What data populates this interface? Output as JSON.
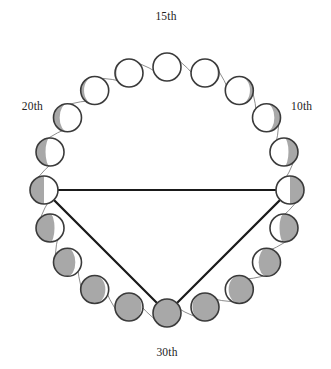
{
  "figure": {
    "background_color": "#ffffff",
    "ring": {
      "center_x": 167,
      "center_y": 190,
      "radius": 123,
      "arc_stroke_color": "#8d8d8d",
      "arc_stroke_width": 1
    },
    "moon_style": {
      "radius": 14,
      "outline_color": "#3a3a3a",
      "outline_width": 1.6,
      "lit_color": "#ffffff",
      "shadow_color": "#a8a8a8"
    },
    "triangle": {
      "stroke_color": "#1a1a1a",
      "stroke_width": 2.2,
      "vertices": [
        "20th",
        "10th",
        "30th"
      ]
    }
  },
  "labels": [
    {
      "id": "label-15th",
      "text": "15th",
      "x": 166,
      "y": 20,
      "anchor": "middle"
    },
    {
      "id": "label-10th",
      "text": "10th",
      "x": 291,
      "y": 110,
      "anchor": "start"
    },
    {
      "id": "label-20th",
      "text": "20th",
      "x": 43,
      "y": 110,
      "anchor": "end"
    },
    {
      "id": "label-30th",
      "text": "30th",
      "x": 167,
      "y": 356,
      "anchor": "middle"
    }
  ],
  "chart_data": {
    "type": "scatter",
    "xlabel": "",
    "ylabel": "",
    "grid": false,
    "legend": "none",
    "categories": [
      "1",
      "2",
      "3",
      "4",
      "5",
      "6",
      "7",
      "8",
      "9",
      "10",
      "11",
      "12",
      "13",
      "14",
      "15",
      "16",
      "17",
      "18",
      "19",
      "20"
    ],
    "values": [
      0,
      0.05,
      0.12,
      0.22,
      0.34,
      0.5,
      0.66,
      0.78,
      0.88,
      0.95,
      1,
      0.95,
      0.88,
      0.78,
      0.66,
      0.5,
      0.34,
      0.22,
      0.12,
      0.05
    ],
    "series": [
      {
        "name": "shadow_fraction",
        "values": [
          0,
          0.05,
          0.12,
          0.22,
          0.34,
          0.5,
          0.66,
          0.78,
          0.88,
          0.95,
          1,
          0.95,
          0.88,
          0.78,
          0.66,
          0.5,
          0.34,
          0.22,
          0.12,
          0.05
        ]
      }
    ],
    "moons": [
      {
        "index": 0,
        "angle_deg": -90,
        "shadow_fraction": 0.0,
        "shadow_side": "none",
        "label": "15th"
      },
      {
        "index": 1,
        "angle_deg": -72,
        "shadow_fraction": 0.05,
        "shadow_side": "right",
        "label": ""
      },
      {
        "index": 2,
        "angle_deg": -54,
        "shadow_fraction": 0.12,
        "shadow_side": "right",
        "label": ""
      },
      {
        "index": 3,
        "angle_deg": -36,
        "shadow_fraction": 0.22,
        "shadow_side": "right",
        "label": ""
      },
      {
        "index": 4,
        "angle_deg": -18,
        "shadow_fraction": 0.34,
        "shadow_side": "right",
        "label": ""
      },
      {
        "index": 5,
        "angle_deg": 0,
        "shadow_fraction": 0.5,
        "shadow_side": "right",
        "label": "10th"
      },
      {
        "index": 6,
        "angle_deg": 18,
        "shadow_fraction": 0.66,
        "shadow_side": "right",
        "label": ""
      },
      {
        "index": 7,
        "angle_deg": 36,
        "shadow_fraction": 0.78,
        "shadow_side": "right",
        "label": ""
      },
      {
        "index": 8,
        "angle_deg": 54,
        "shadow_fraction": 0.88,
        "shadow_side": "right",
        "label": ""
      },
      {
        "index": 9,
        "angle_deg": 72,
        "shadow_fraction": 0.95,
        "shadow_side": "right",
        "label": ""
      },
      {
        "index": 10,
        "angle_deg": 90,
        "shadow_fraction": 1.0,
        "shadow_side": "full",
        "label": "30th"
      },
      {
        "index": 11,
        "angle_deg": 108,
        "shadow_fraction": 0.95,
        "shadow_side": "left",
        "label": ""
      },
      {
        "index": 12,
        "angle_deg": 126,
        "shadow_fraction": 0.88,
        "shadow_side": "left",
        "label": ""
      },
      {
        "index": 13,
        "angle_deg": 144,
        "shadow_fraction": 0.78,
        "shadow_side": "left",
        "label": ""
      },
      {
        "index": 14,
        "angle_deg": 162,
        "shadow_fraction": 0.66,
        "shadow_side": "left",
        "label": ""
      },
      {
        "index": 15,
        "angle_deg": 180,
        "shadow_fraction": 0.5,
        "shadow_side": "left",
        "label": "20th"
      },
      {
        "index": 16,
        "angle_deg": 198,
        "shadow_fraction": 0.34,
        "shadow_side": "left",
        "label": ""
      },
      {
        "index": 17,
        "angle_deg": 216,
        "shadow_fraction": 0.22,
        "shadow_side": "left",
        "label": ""
      },
      {
        "index": 18,
        "angle_deg": 234,
        "shadow_fraction": 0.12,
        "shadow_side": "left",
        "label": ""
      },
      {
        "index": 19,
        "angle_deg": 252,
        "shadow_fraction": 0.05,
        "shadow_side": "left",
        "label": ""
      }
    ]
  }
}
